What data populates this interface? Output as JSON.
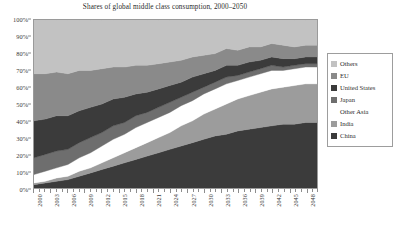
{
  "chart_data": {
    "type": "area",
    "title": "Shares of global middle class consumption, 2000–2050",
    "xlabel": "",
    "ylabel": "",
    "stacked": true,
    "normalized_percent": true,
    "grid": false,
    "legend_position": "right",
    "ylim": [
      0,
      100
    ],
    "xlim": [
      2000,
      2050
    ],
    "ytick_labels": [
      "100%",
      "90%",
      "80%",
      "70%",
      "60%",
      "50%",
      "40%",
      "30%",
      "20%",
      "10%",
      "0%"
    ],
    "ytick_values": [
      100,
      90,
      80,
      70,
      60,
      50,
      40,
      30,
      20,
      10,
      0
    ],
    "xtick_labels": [
      "2000",
      "2003",
      "2006",
      "2009",
      "2012",
      "2015",
      "2018",
      "2021",
      "2024",
      "2027",
      "2030",
      "2033",
      "2036",
      "2039",
      "2042",
      "2045",
      "2048"
    ],
    "xtick_values": [
      2000,
      2003,
      2006,
      2009,
      2012,
      2015,
      2018,
      2021,
      2024,
      2027,
      2030,
      2033,
      2036,
      2039,
      2042,
      2045,
      2048
    ],
    "x": [
      2000,
      2002,
      2004,
      2006,
      2008,
      2010,
      2012,
      2014,
      2016,
      2018,
      2020,
      2022,
      2024,
      2026,
      2028,
      2030,
      2032,
      2034,
      2036,
      2038,
      2040,
      2042,
      2044,
      2046,
      2048,
      2050
    ],
    "stack_order_bottom_to_top": [
      "China",
      "India",
      "Other Asia",
      "Japan",
      "United States",
      "EU",
      "Others"
    ],
    "series": [
      {
        "name": "China",
        "color": "#3b3b3b",
        "values": [
          2,
          3,
          4,
          5,
          7,
          9,
          11,
          13,
          15,
          17,
          19,
          21,
          23,
          25,
          27,
          29,
          31,
          32,
          34,
          35,
          36,
          37,
          38,
          38,
          39,
          39
        ]
      },
      {
        "name": "India",
        "color": "#9c9c9c",
        "values": [
          1,
          1,
          2,
          2,
          3,
          3,
          4,
          5,
          6,
          7,
          8,
          9,
          10,
          12,
          13,
          15,
          16,
          18,
          19,
          20,
          21,
          22,
          22,
          23,
          23,
          23
        ]
      },
      {
        "name": "Other Asia",
        "color": "#ffffff",
        "values": [
          5,
          6,
          6,
          7,
          8,
          9,
          10,
          11,
          11,
          12,
          12,
          12,
          12,
          12,
          12,
          12,
          12,
          12,
          11,
          11,
          11,
          11,
          10,
          10,
          10,
          10
        ]
      },
      {
        "name": "Japan",
        "color": "#6e6e6e",
        "values": [
          10,
          10,
          10,
          9,
          9,
          9,
          8,
          8,
          7,
          7,
          6,
          6,
          6,
          5,
          5,
          4,
          4,
          4,
          3,
          3,
          3,
          3,
          2,
          2,
          2,
          2
        ]
      },
      {
        "name": "United States",
        "color": "#3b3b3b",
        "values": [
          22,
          21,
          21,
          20,
          19,
          18,
          17,
          16,
          15,
          13,
          12,
          11,
          10,
          9,
          9,
          8,
          7,
          7,
          6,
          6,
          5,
          5,
          5,
          4,
          4,
          4
        ]
      },
      {
        "name": "EU",
        "color": "#8a8a8a",
        "values": [
          28,
          27,
          26,
          25,
          24,
          22,
          21,
          19,
          18,
          17,
          16,
          15,
          14,
          13,
          12,
          11,
          10,
          10,
          9,
          9,
          8,
          8,
          8,
          7,
          7,
          7
        ]
      },
      {
        "name": "Others",
        "color": "#c2c2c2",
        "values": [
          32,
          32,
          31,
          32,
          30,
          30,
          29,
          28,
          28,
          27,
          27,
          26,
          25,
          24,
          22,
          21,
          20,
          17,
          18,
          16,
          16,
          14,
          15,
          16,
          15,
          15
        ]
      }
    ]
  },
  "legend": {
    "items": [
      {
        "label": "Others",
        "color": "#c2c2c2",
        "swatch": true
      },
      {
        "label": "EU",
        "color": "#8a8a8a",
        "swatch": true
      },
      {
        "label": "United States",
        "color": "#3b3b3b",
        "swatch": true
      },
      {
        "label": "Japan",
        "color": "#6e6e6e",
        "swatch": true
      },
      {
        "label": "Other Asia",
        "color": "#ffffff",
        "swatch": false
      },
      {
        "label": "India",
        "color": "#9c9c9c",
        "swatch": true
      },
      {
        "label": "China",
        "color": "#3b3b3b",
        "swatch": true
      }
    ]
  }
}
